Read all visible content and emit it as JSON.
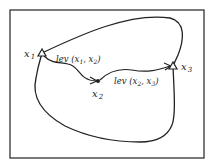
{
  "diagram": {
    "frame": {
      "x": 10,
      "y": 10,
      "w": 194,
      "h": 148
    },
    "colors": {
      "stroke": "#222222",
      "background": "#ffffff"
    },
    "nodes": [
      {
        "id": "x1",
        "label": "x",
        "sub": "1",
        "marker": "triangle",
        "x": 42,
        "y": 53,
        "lx": 24,
        "ly": 57
      },
      {
        "id": "x2",
        "label": "x",
        "sub": "2",
        "marker": "dot",
        "x": 98,
        "y": 81,
        "lx": 93,
        "ly": 96
      },
      {
        "id": "x3",
        "label": "x",
        "sub": "3",
        "marker": "triangle",
        "x": 173,
        "y": 66,
        "lx": 181,
        "ly": 70
      }
    ],
    "edges": [
      {
        "from": "x1",
        "to": "x2",
        "label": "lev (x₁, x₂)",
        "lx": 56,
        "ly": 62
      },
      {
        "from": "x2",
        "to": "x3",
        "label": "lev (x₂, x₃)",
        "lx": 114,
        "ly": 84
      }
    ],
    "region": "closed curve enclosing x1 and x3"
  },
  "labels": {
    "x1": "x",
    "x1_sub": "1",
    "x2": "x",
    "x2_sub": "2",
    "x3": "x",
    "x3_sub": "3",
    "lev12": "lev (x",
    "lev12_a": "1",
    "lev12_mid": ", x",
    "lev12_b": "2",
    "lev12_end": ")",
    "lev23": "lev (x",
    "lev23_a": "2",
    "lev23_mid": ", x",
    "lev23_b": "3",
    "lev23_end": ")"
  }
}
